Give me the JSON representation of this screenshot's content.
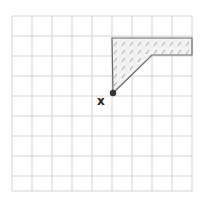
{
  "diagram": {
    "grid": {
      "columns": 9,
      "rows": 9,
      "left": 12,
      "top": 16,
      "cell": 20,
      "line_color": "#c8c8c8"
    },
    "shaded_region": {
      "fill_pattern": "hatched",
      "stroke_color": "#666666",
      "hatch_color": "#9a9a9a",
      "fill_color": "#f2f2f2",
      "vertices": [
        [
          112,
          38
        ],
        [
          192,
          38
        ],
        [
          192,
          55
        ],
        [
          152,
          55
        ],
        [
          113,
          93
        ]
      ]
    },
    "point": {
      "x": 113,
      "y": 93,
      "color": "#333333",
      "label": "x"
    }
  }
}
